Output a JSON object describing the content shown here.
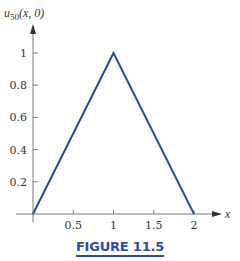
{
  "chart_data": {
    "type": "line",
    "title": "",
    "xlabel": "x",
    "ylabel": "u_50(x, 0)",
    "ylabel_parts": {
      "base": "u",
      "sub": "50",
      "rest": "(x, 0)"
    },
    "x": [
      0,
      1,
      2
    ],
    "series": [
      {
        "name": "u50(x,0)",
        "color": "#2b4aa0",
        "values": [
          0,
          1,
          0
        ]
      }
    ],
    "xticks": [
      0.5,
      1,
      1.5,
      2
    ],
    "xtick_labels": [
      "0.5",
      "1",
      "1.5",
      "2"
    ],
    "yticks": [
      0.2,
      0.4,
      0.6,
      0.8,
      1
    ],
    "ytick_labels": [
      "0.2",
      "0.4",
      "0.6",
      "0.8",
      "1"
    ],
    "xlim": [
      0,
      2.3
    ],
    "ylim": [
      0,
      1.15
    ],
    "grid": false,
    "legend": "none"
  },
  "figure": {
    "caption": "FIGURE 11.5"
  }
}
